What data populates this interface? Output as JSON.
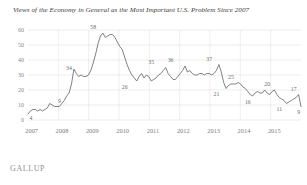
{
  "chart_data": {
    "type": "line",
    "title": "Views of the Economy in General as the Most Important U.S. Problem Since 2007",
    "xlabel": "",
    "ylabel": "",
    "ylim": [
      0,
      60
    ],
    "yticks": [
      0,
      10,
      20,
      30,
      40,
      50,
      60
    ],
    "ytick_labels": [
      "0",
      "10",
      "20",
      "30",
      "40",
      "50",
      "60"
    ],
    "xtick_labels": [
      "2007",
      "2008",
      "2009",
      "2010",
      "2011",
      "2012",
      "2013",
      "2014",
      "2015"
    ],
    "grid": "horizontal-and-vertical",
    "legend": "none",
    "series_name": "Economy in general (% naming as most important problem)",
    "line_color": "#6a6a6a",
    "annotations": [
      {
        "label": "4",
        "value": 4,
        "x_index": 0
      },
      {
        "label": "9",
        "value": 9,
        "x_index": 13
      },
      {
        "label": "34",
        "value": 34,
        "x_index": 19
      },
      {
        "label": "58",
        "value": 58,
        "x_index": 27
      },
      {
        "label": "26",
        "value": 26,
        "x_index": 40
      },
      {
        "label": "35",
        "value": 35,
        "x_index": 51
      },
      {
        "label": "36",
        "value": 36,
        "x_index": 59
      },
      {
        "label": "37",
        "value": 37,
        "x_index": 75
      },
      {
        "label": "21",
        "value": 21,
        "x_index": 78
      },
      {
        "label": "25",
        "value": 25,
        "x_index": 84
      },
      {
        "label": "16",
        "value": 16,
        "x_index": 91
      },
      {
        "label": "20",
        "value": 20,
        "x_index": 99
      },
      {
        "label": "11",
        "value": 11,
        "x_index": 104
      },
      {
        "label": "17",
        "value": 17,
        "x_index": 110
      },
      {
        "label": "9",
        "value": 9,
        "x_index": 112
      }
    ],
    "values": [
      4,
      6,
      7,
      7,
      6,
      7,
      6,
      7,
      8,
      11,
      10,
      9,
      9,
      9,
      11,
      13,
      16,
      18,
      24,
      34,
      31,
      29,
      30,
      29,
      29,
      30,
      33,
      38,
      44,
      51,
      56,
      58,
      55,
      56,
      57,
      57,
      55,
      52,
      49,
      47,
      42,
      37,
      33,
      30,
      28,
      26,
      29,
      31,
      28,
      30,
      29,
      26,
      27,
      28,
      30,
      31,
      33,
      35,
      31,
      29,
      27,
      27,
      29,
      31,
      33,
      36,
      32,
      33,
      31,
      30,
      30,
      31,
      31,
      30,
      31,
      31,
      30,
      31,
      33,
      37,
      32,
      25,
      21,
      23,
      24,
      24,
      24,
      25,
      24,
      22,
      21,
      19,
      17,
      16,
      18,
      19,
      18,
      18,
      20,
      18,
      17,
      19,
      20,
      17,
      15,
      14,
      13,
      11,
      12,
      13,
      14,
      15,
      17,
      9
    ]
  },
  "footer": {
    "brand": "GALLUP"
  }
}
